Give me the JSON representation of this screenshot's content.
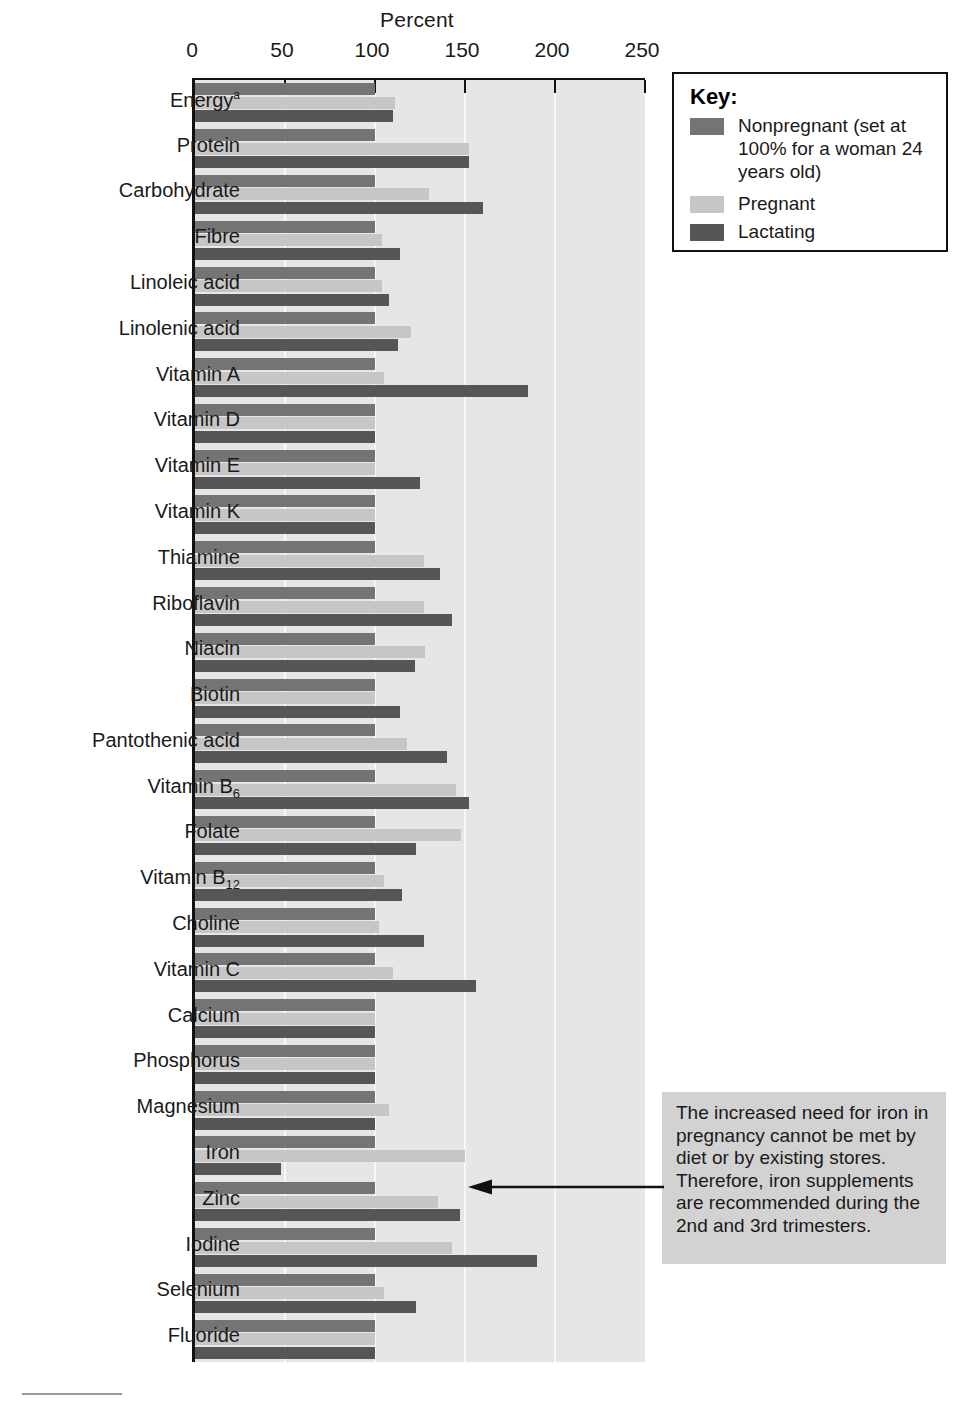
{
  "chart_data": {
    "type": "bar",
    "title": "",
    "xlabel": "Percent",
    "ylabel": "",
    "xlim": [
      0,
      250
    ],
    "xticks": [
      0,
      50,
      100,
      150,
      200,
      250
    ],
    "orientation": "horizontal",
    "grid": true,
    "legend_position": "top-right",
    "categories": [
      "Energyᵃ",
      "Protein",
      "Carbohydrate",
      "Fibre",
      "Linoleic acid",
      "Linolenic acid",
      "Vitamin A",
      "Vitamin D",
      "Vitamin E",
      "Vitamin K",
      "Thiamine",
      "Riboflavin",
      "Niacin",
      "Biotin",
      "Pantothenic acid",
      "Vitamin B₆",
      "Folate",
      "Vitamin B₁₂",
      "Choline",
      "Vitamin C",
      "Calcium",
      "Phosphorus",
      "Magnesium",
      "Iron",
      "Zinc",
      "Iodine",
      "Selenium",
      "Fluoride"
    ],
    "series": [
      {
        "name": "Nonpregnant (set at 100% for a woman 24 years old)",
        "short_name": "Nonpregnant",
        "color": "#747474",
        "values": [
          100,
          100,
          100,
          100,
          100,
          100,
          100,
          100,
          100,
          100,
          100,
          100,
          100,
          100,
          100,
          100,
          100,
          100,
          100,
          100,
          100,
          100,
          100,
          100,
          100,
          100,
          100,
          100
        ]
      },
      {
        "name": "Pregnant",
        "short_name": "Pregnant",
        "color": "#c6c6c6",
        "values": [
          111,
          152,
          130,
          104,
          104,
          120,
          105,
          100,
          100,
          100,
          127,
          127,
          128,
          100,
          118,
          145,
          148,
          105,
          102,
          110,
          100,
          100,
          108,
          150,
          135,
          143,
          105,
          100
        ]
      },
      {
        "name": "Lactating",
        "short_name": "Lactating",
        "color": "#565656",
        "values": [
          110,
          152,
          160,
          114,
          108,
          113,
          185,
          100,
          125,
          100,
          136,
          143,
          122,
          114,
          140,
          152,
          123,
          115,
          127,
          156,
          100,
          100,
          100,
          48,
          147,
          190,
          123,
          100
        ]
      }
    ]
  },
  "axis": {
    "title": "Percent",
    "tick_labels": [
      "0",
      "50",
      "100",
      "150",
      "200",
      "250"
    ]
  },
  "categories_display": [
    {
      "label": "Energy",
      "sup": "a",
      "sub": ""
    },
    {
      "label": "Protein",
      "sup": "",
      "sub": ""
    },
    {
      "label": "Carbohydrate",
      "sup": "",
      "sub": ""
    },
    {
      "label": "Fibre",
      "sup": "",
      "sub": ""
    },
    {
      "label": "Linoleic acid",
      "sup": "",
      "sub": ""
    },
    {
      "label": "Linolenic acid",
      "sup": "",
      "sub": ""
    },
    {
      "label": "Vitamin A",
      "sup": "",
      "sub": ""
    },
    {
      "label": "Vitamin D",
      "sup": "",
      "sub": ""
    },
    {
      "label": "Vitamin E",
      "sup": "",
      "sub": ""
    },
    {
      "label": "Vitamin K",
      "sup": "",
      "sub": ""
    },
    {
      "label": "Thiamine",
      "sup": "",
      "sub": ""
    },
    {
      "label": "Riboflavin",
      "sup": "",
      "sub": ""
    },
    {
      "label": "Niacin",
      "sup": "",
      "sub": ""
    },
    {
      "label": "Biotin",
      "sup": "",
      "sub": ""
    },
    {
      "label": "Pantothenic acid",
      "sup": "",
      "sub": ""
    },
    {
      "label": "Vitamin B",
      "sup": "",
      "sub": "6"
    },
    {
      "label": "Folate",
      "sup": "",
      "sub": ""
    },
    {
      "label": "Vitamin B",
      "sup": "",
      "sub": "12"
    },
    {
      "label": "Choline",
      "sup": "",
      "sub": ""
    },
    {
      "label": "Vitamin C",
      "sup": "",
      "sub": ""
    },
    {
      "label": "Calcium",
      "sup": "",
      "sub": ""
    },
    {
      "label": "Phosphorus",
      "sup": "",
      "sub": ""
    },
    {
      "label": "Magnesium",
      "sup": "",
      "sub": ""
    },
    {
      "label": "Iron",
      "sup": "",
      "sub": ""
    },
    {
      "label": "Zinc",
      "sup": "",
      "sub": ""
    },
    {
      "label": "Iodine",
      "sup": "",
      "sub": ""
    },
    {
      "label": "Selenium",
      "sup": "",
      "sub": ""
    },
    {
      "label": "Fluoride",
      "sup": "",
      "sub": ""
    }
  ],
  "key": {
    "title": "Key:",
    "items": [
      {
        "label": "Nonpregnant (set at 100% for a woman 24 years old)",
        "color": "#747474",
        "swatch": "nonpregnant-swatch"
      },
      {
        "label": "Pregnant",
        "color": "#c6c6c6",
        "swatch": "pregnant-swatch"
      },
      {
        "label": "Lactating",
        "color": "#565656",
        "swatch": "lactating-swatch"
      }
    ]
  },
  "annotation": {
    "text": "The increased need for iron in pregnancy cannot be met by diet or by existing stores. Therefore, iron supplements are recommended during the 2nd and 3rd trimesters.",
    "points_to": "Iron",
    "background": "#d2d2d2"
  },
  "colors": {
    "plot_background": "#e6e6e6",
    "gridline": "#f7f7f7",
    "axis": "#111111",
    "nonpregnant": "#747474",
    "pregnant": "#c6c6c6",
    "lactating": "#565656"
  }
}
